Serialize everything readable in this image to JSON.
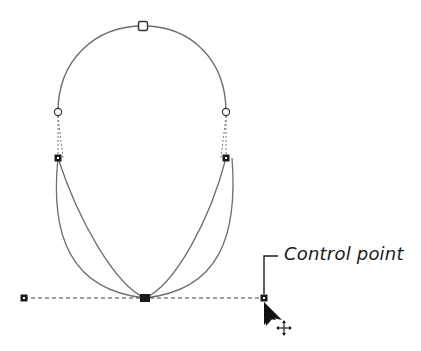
{
  "diagram": {
    "callout": {
      "label": "Control point"
    },
    "colors": {
      "curve": "#6e6e6e",
      "handle_line": "#444444",
      "node_fill": "#1a1a1a",
      "open_node_stroke": "#333333",
      "background": "#ffffff"
    },
    "nodes": {
      "top_anchor": {
        "x": 143,
        "y": 26,
        "type": "open-square"
      },
      "left_upper": {
        "x": 58,
        "y": 112,
        "type": "open-circle"
      },
      "right_upper": {
        "x": 226,
        "y": 112,
        "type": "open-circle"
      },
      "left_lower": {
        "x": 58,
        "y": 158,
        "type": "filled-square"
      },
      "right_lower": {
        "x": 226,
        "y": 158,
        "type": "filled-square"
      },
      "bottom_anchor": {
        "x": 145,
        "y": 298,
        "type": "filled-square-large"
      },
      "left_handle": {
        "x": 24,
        "y": 298,
        "type": "filled-square"
      },
      "right_handle": {
        "x": 264,
        "y": 298,
        "type": "filled-square"
      }
    },
    "cursor": {
      "type": "arrow-with-move",
      "x": 264,
      "y": 302
    }
  }
}
